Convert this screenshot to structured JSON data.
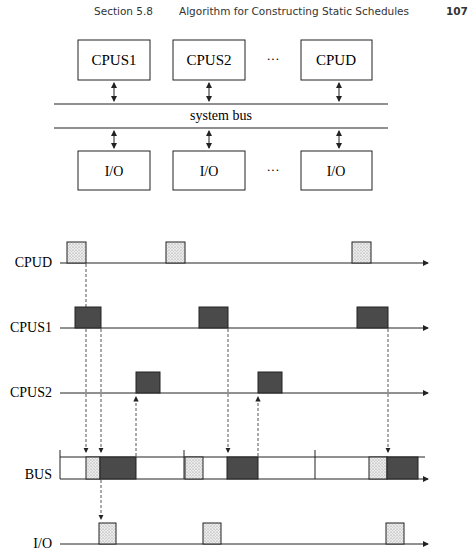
{
  "header": {
    "section": "Section 5.8",
    "title": "Algorithm for Constructing Static Schedules",
    "page_number": "107"
  },
  "architecture": {
    "cpus": [
      "CPUS1",
      "CPUS2",
      "CPUD"
    ],
    "ellipsis": "···",
    "bus_label": "system bus",
    "io": [
      "I/O",
      "I/O",
      "I/O"
    ]
  },
  "timing": {
    "rows": [
      {
        "label": "CPUD",
        "y": 263,
        "fill": "dotted",
        "blocks": [
          [
            67,
            86
          ],
          [
            166,
            185
          ],
          [
            352,
            371
          ]
        ]
      },
      {
        "label": "CPUS1",
        "y": 328,
        "fill": "dark",
        "blocks": [
          [
            75,
            101
          ],
          [
            199,
            228
          ],
          [
            357,
            388
          ]
        ]
      },
      {
        "label": "CPUS2",
        "y": 393,
        "fill": "dark",
        "blocks": [
          [
            136,
            160
          ],
          [
            258,
            282
          ]
        ]
      },
      {
        "label": "BUS",
        "y": 479,
        "fill": "mixed",
        "segments": [
          {
            "x": [
              86,
              100
            ],
            "fill": "dotted"
          },
          {
            "x": [
              100,
              136
            ],
            "fill": "dark"
          },
          {
            "x": [
              185,
              203
            ],
            "fill": "dotted"
          },
          {
            "x": [
              227,
              258
            ],
            "fill": "dark"
          },
          {
            "x": [
              369,
              387
            ],
            "fill": "dotted"
          },
          {
            "x": [
              387,
              418
            ],
            "fill": "dark"
          }
        ],
        "separators": [
          184,
          315
        ]
      },
      {
        "label": "I/O",
        "y": 544,
        "fill": "dotted",
        "blocks": [
          [
            99,
            116
          ],
          [
            203,
            221
          ],
          [
            386,
            404
          ]
        ]
      }
    ],
    "colors": {
      "dark": "#4a4a4a",
      "dotted": "#e6e6e6",
      "line": "#222222"
    }
  }
}
